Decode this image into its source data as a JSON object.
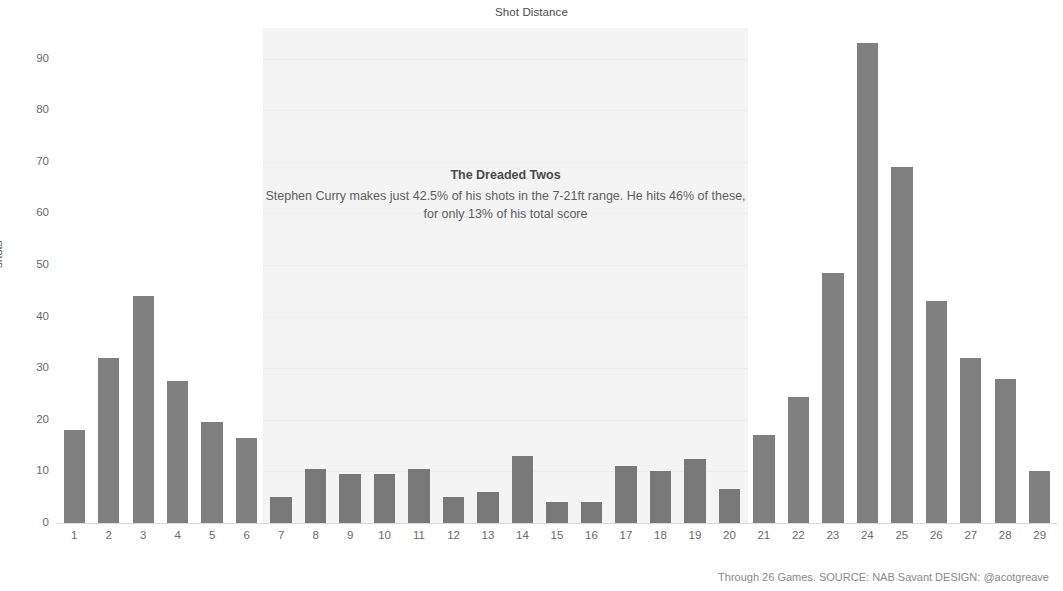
{
  "chart_data": {
    "type": "bar",
    "title": "Shot Distance",
    "xlabel": "",
    "ylabel": "shots",
    "ylim": [
      0,
      95
    ],
    "yticks": [
      0,
      10,
      20,
      30,
      40,
      50,
      60,
      70,
      80,
      90
    ],
    "grid": true,
    "legend": null,
    "categories": [
      1,
      2,
      3,
      4,
      5,
      6,
      7,
      8,
      9,
      10,
      11,
      12,
      13,
      14,
      15,
      16,
      17,
      18,
      19,
      20,
      21,
      22,
      23,
      24,
      25,
      26,
      27,
      28,
      29
    ],
    "values": [
      18,
      32,
      44,
      27.5,
      19.5,
      16.5,
      5,
      10.5,
      9.5,
      9.5,
      10.5,
      5,
      6,
      13,
      4,
      4,
      11,
      10,
      12.5,
      6.5,
      17,
      24.5,
      48.5,
      93,
      69,
      43,
      32,
      28,
      10
    ],
    "highlight_range": [
      7,
      20
    ],
    "annotations": [
      {
        "title": "The Dreaded Twos",
        "body": "Stephen Curry makes just 42.5% of his shots in the 7-21ft range. He hits 46% of these, for only 13% of his total score"
      }
    ],
    "colors": {
      "bar": "#808080",
      "bar_highlight": "#787878",
      "band": "#f4f4f4",
      "text": "#5d5d5d"
    }
  },
  "footer": {
    "note": "Through 26 Games. SOURCE: NAB Savant DESIGN: @acotgreave"
  }
}
